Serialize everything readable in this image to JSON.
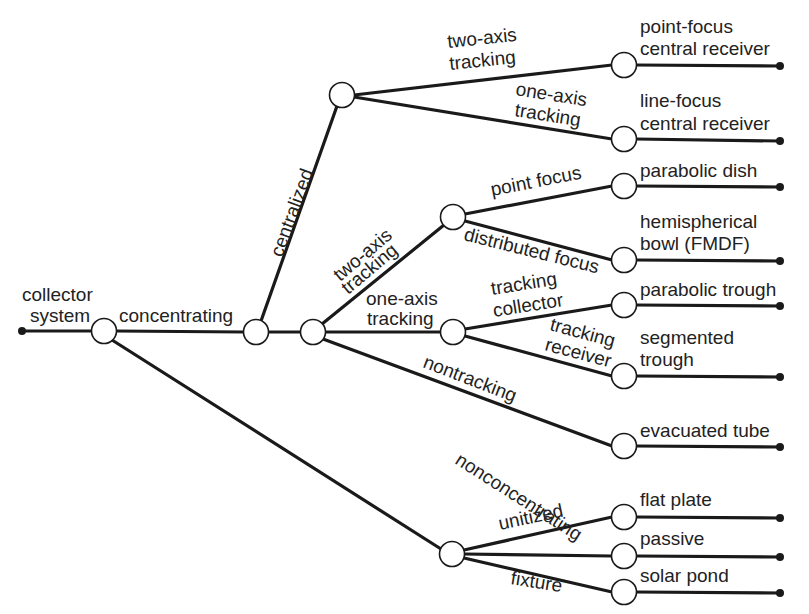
{
  "diagram": {
    "root": {
      "label_line1": "collector",
      "label_line2": "system"
    },
    "branches": {
      "concentrating": "concentrating",
      "nonconcentrating": "nonconcentrating",
      "centralized": "centralized",
      "two_axis_tracking_line1": "two-axis",
      "two_axis_tracking_line2": "tracking",
      "one_axis_tracking_line1": "one-axis",
      "one_axis_tracking_line2": "tracking",
      "nontracking": "nontracking",
      "central_two_axis_line1": "two-axis",
      "central_two_axis_line2": "tracking",
      "central_one_axis_line1": "one-axis",
      "central_one_axis_line2": "tracking",
      "point_focus": "point focus",
      "distributed_focus": "distributed focus",
      "tracking_collector_line1": "tracking",
      "tracking_collector_line2": "collector",
      "tracking_receiver_line1": "tracking",
      "tracking_receiver_line2": "receiver",
      "unitized": "unitized",
      "fixture": "fixture"
    },
    "leaves": [
      {
        "line1": "point-focus",
        "line2": "central receiver"
      },
      {
        "line1": "line-focus",
        "line2": "central receiver"
      },
      {
        "line1": "parabolic dish",
        "line2": ""
      },
      {
        "line1": "hemispherical",
        "line2": "bowl (FMDF)"
      },
      {
        "line1": "parabolic trough",
        "line2": ""
      },
      {
        "line1": "segmented",
        "line2": "trough"
      },
      {
        "line1": "evacuated tube",
        "line2": ""
      },
      {
        "line1": "flat plate",
        "line2": ""
      },
      {
        "line1": "passive",
        "line2": ""
      },
      {
        "line1": "solar pond",
        "line2": ""
      }
    ]
  }
}
